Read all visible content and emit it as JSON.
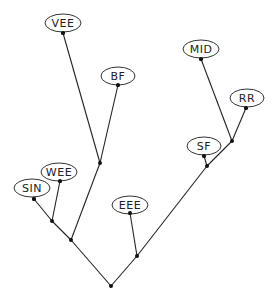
{
  "diagram": {
    "type": "tree",
    "colors": {
      "line": "#222222",
      "node": "#111111",
      "label_border": "#333333",
      "background": "#ffffff"
    },
    "leaves": [
      {
        "id": "VEE",
        "label": "VEE",
        "lx": 63,
        "ly": 23,
        "rx": 18,
        "ry": 9,
        "nx": 63,
        "ny": 33
      },
      {
        "id": "BF",
        "label": "BF",
        "lx": 118,
        "ly": 76,
        "rx": 17,
        "ry": 9,
        "nx": 118,
        "ny": 85
      },
      {
        "id": "MID",
        "label": "MID",
        "lx": 201,
        "ly": 49,
        "rx": 18,
        "ry": 9,
        "nx": 201,
        "ny": 59
      },
      {
        "id": "RR",
        "label": "RR",
        "lx": 247,
        "ly": 98,
        "rx": 17,
        "ry": 9,
        "nx": 246,
        "ny": 108
      },
      {
        "id": "SF",
        "label": "SF",
        "lx": 204,
        "ly": 146,
        "rx": 17,
        "ry": 9,
        "nx": 204,
        "ny": 156
      },
      {
        "id": "SIN",
        "label": "SIN",
        "lx": 32,
        "ly": 188,
        "rx": 18,
        "ry": 9,
        "nx": 34,
        "ny": 199
      },
      {
        "id": "WEE",
        "label": "WEE",
        "lx": 59,
        "ly": 172,
        "rx": 18,
        "ry": 9,
        "nx": 60,
        "ny": 181
      },
      {
        "id": "EEE",
        "label": "EEE",
        "lx": 130,
        "ly": 205,
        "rx": 18,
        "ry": 9,
        "nx": 130,
        "ny": 213
      }
    ],
    "internal_nodes": [
      {
        "id": "n_vee_bf",
        "x": 100,
        "y": 163
      },
      {
        "id": "n_sin_wee",
        "x": 52,
        "y": 221
      },
      {
        "id": "n_left",
        "x": 71,
        "y": 240
      },
      {
        "id": "n_mid_rr",
        "x": 232,
        "y": 141
      },
      {
        "id": "n_sf",
        "x": 207,
        "y": 166
      },
      {
        "id": "n_eee",
        "x": 137,
        "y": 256
      },
      {
        "id": "root",
        "x": 111,
        "y": 286
      }
    ],
    "edges": [
      [
        "VEE",
        "n_vee_bf"
      ],
      [
        "BF",
        "n_vee_bf"
      ],
      [
        "SIN",
        "n_sin_wee"
      ],
      [
        "WEE",
        "n_sin_wee"
      ],
      [
        "n_sin_wee",
        "n_left"
      ],
      [
        "n_vee_bf",
        "n_left"
      ],
      [
        "n_left",
        "root"
      ],
      [
        "MID",
        "n_mid_rr"
      ],
      [
        "RR",
        "n_mid_rr"
      ],
      [
        "n_mid_rr",
        "n_sf"
      ],
      [
        "SF",
        "n_sf"
      ],
      [
        "n_sf",
        "n_eee"
      ],
      [
        "EEE",
        "n_eee"
      ],
      [
        "n_eee",
        "root"
      ]
    ]
  }
}
